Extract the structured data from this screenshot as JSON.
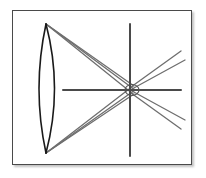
{
  "figure": {
    "caption": "",
    "frame": {
      "x": 12,
      "y": 10,
      "width": 180,
      "height": 155,
      "border_color": "#4a4a4a",
      "background_color": "#ffffff",
      "shadow_color": "#787878"
    },
    "colors": {
      "lens_stroke": "#1a1a1a",
      "ray_stroke": "#6e6e6e",
      "axis_stroke": "#4a4a4a",
      "focal_marker_stroke": "#555555"
    },
    "lens": {
      "name": "biconvex-lens",
      "top_vertex": [
        33,
        13
      ],
      "bottom_vertex": [
        33,
        142
      ],
      "left_bulge_x": 19,
      "right_bulge_x": 50,
      "stroke_width": 1.6
    },
    "optical_axis": {
      "name": "optical-axis",
      "x1": 50,
      "y1": 79,
      "x2": 168,
      "y2": 79,
      "stroke_width": 2
    },
    "image_plane_axis": {
      "name": "image-plane-axis",
      "x": 117,
      "y1": 13,
      "y2": 145,
      "stroke_width": 2
    },
    "focal_point": {
      "name": "focal-point-marker",
      "cx": 119,
      "cy": 79,
      "rx": 7,
      "ry": 5.5,
      "stroke_width": 1.2
    },
    "rays": {
      "upper_fan_origin": [
        33,
        13
      ],
      "lower_fan_origin": [
        33,
        142
      ],
      "convergence": [
        119,
        79
      ],
      "upper_incoming": [
        {
          "x1": 33,
          "y1": 13,
          "x2": 121,
          "y2": 75
        },
        {
          "x1": 33,
          "y1": 13,
          "x2": 122,
          "y2": 79
        },
        {
          "x1": 33,
          "y1": 13,
          "x2": 120,
          "y2": 83
        }
      ],
      "lower_incoming": [
        {
          "x1": 33,
          "y1": 142,
          "x2": 121,
          "y2": 83
        },
        {
          "x1": 33,
          "y1": 142,
          "x2": 122,
          "y2": 79
        },
        {
          "x1": 33,
          "y1": 142,
          "x2": 120,
          "y2": 75
        }
      ],
      "upper_outgoing": [
        {
          "x1": 118,
          "y1": 76,
          "x2": 168,
          "y2": 40
        },
        {
          "x1": 119,
          "y1": 78,
          "x2": 172,
          "y2": 49
        }
      ],
      "lower_outgoing": [
        {
          "x1": 118,
          "y1": 82,
          "x2": 168,
          "y2": 118
        },
        {
          "x1": 119,
          "y1": 80,
          "x2": 172,
          "y2": 109
        }
      ],
      "stroke_width": 1.3
    }
  }
}
